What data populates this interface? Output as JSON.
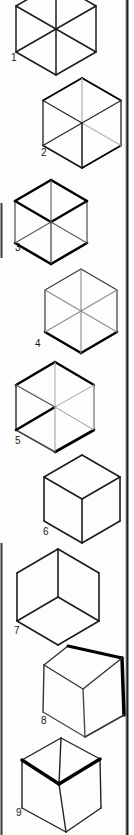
{
  "page": {
    "background": "#fdfdfd",
    "width": 134,
    "height": 835,
    "rules": [
      {
        "name": "right-column-rule-gray",
        "x": 125.8,
        "y1": 0,
        "y2": 835,
        "width": 1,
        "color": "#b5b5b5"
      },
      {
        "name": "right-column-rule",
        "x": 127.4,
        "y1": 0,
        "y2": 835,
        "width": 2.2,
        "color": "#1e1e1e"
      },
      {
        "name": "left-page-edge-upper",
        "x": 1.5,
        "y1": 203,
        "y2": 258,
        "width": 2,
        "color": "#3a3a3a"
      },
      {
        "name": "left-page-edge-lower",
        "x": 1.5,
        "y1": 543,
        "y2": 835,
        "width": 2,
        "color": "#3a3a3a"
      }
    ],
    "label_font_size": 10
  },
  "figures": [
    {
      "label": "1",
      "type": "hexagon-all-diagonals-uniform",
      "label_pos": {
        "x": 11,
        "y": 61
      },
      "points": {
        "T": [
          56,
          -17
        ],
        "UL": [
          16,
          6
        ],
        "LL": [
          16,
          52
        ],
        "B": [
          56,
          75
        ],
        "LR": [
          96,
          52
        ],
        "UR": [
          96,
          6
        ],
        "C": [
          56,
          29
        ]
      },
      "lines": [
        {
          "from": "T",
          "to": "UL",
          "w": 1.5,
          "c": "#1c1c1c"
        },
        {
          "from": "T",
          "to": "UR",
          "w": 1.5,
          "c": "#1c1c1c"
        },
        {
          "from": "UL",
          "to": "LL",
          "w": 1.5,
          "c": "#1c1c1c"
        },
        {
          "from": "UR",
          "to": "LR",
          "w": 1.5,
          "c": "#1c1c1c"
        },
        {
          "from": "LL",
          "to": "B",
          "w": 1.5,
          "c": "#1c1c1c"
        },
        {
          "from": "LR",
          "to": "B",
          "w": 1.5,
          "c": "#1c1c1c"
        },
        {
          "from": "T",
          "to": "B",
          "w": 1.5,
          "c": "#1c1c1c"
        },
        {
          "from": "UL",
          "to": "LR",
          "w": 1.5,
          "c": "#1c1c1c"
        },
        {
          "from": "UR",
          "to": "LL",
          "w": 1.5,
          "c": "#1c1c1c"
        }
      ]
    },
    {
      "label": "2",
      "type": "hexagon-hidden-edges-gray",
      "label_pos": {
        "x": 41,
        "y": 156
      },
      "points": {
        "T": [
          82,
          78
        ],
        "UL": [
          43,
          100.5
        ],
        "LL": [
          43,
          145.5
        ],
        "B": [
          82,
          168
        ],
        "LR": [
          121,
          145.5
        ],
        "UR": [
          121,
          100.5
        ],
        "C": [
          82,
          123
        ]
      },
      "lines": [
        {
          "from": "T",
          "to": "UL",
          "w": 2.0,
          "c": "#000000"
        },
        {
          "from": "T",
          "to": "UR",
          "w": 2.0,
          "c": "#000000"
        },
        {
          "from": "UL",
          "to": "LL",
          "w": 1.3,
          "c": "#222222"
        },
        {
          "from": "UR",
          "to": "LR",
          "w": 1.3,
          "c": "#222222"
        },
        {
          "from": "LL",
          "to": "B",
          "w": 1.5,
          "c": "#111111"
        },
        {
          "from": "LR",
          "to": "B",
          "w": 1.8,
          "c": "#000000"
        },
        {
          "from": "C",
          "to": "T",
          "w": 1.2,
          "c": "#b3b3b3"
        },
        {
          "from": "C",
          "to": "LR",
          "w": 1.2,
          "c": "#b3b3b3"
        },
        {
          "from": "C",
          "to": "UL",
          "w": 1.4,
          "c": "#2e2e2e"
        },
        {
          "from": "C",
          "to": "UR",
          "w": 1.4,
          "c": "#2e2e2e"
        },
        {
          "from": "C",
          "to": "LL",
          "w": 1.4,
          "c": "#2e2e2e"
        },
        {
          "from": "C",
          "to": "B",
          "w": 1.5,
          "c": "#1a1a1a"
        }
      ]
    },
    {
      "label": "3",
      "type": "hexagon-top-face-and-bottom-edges-bold",
      "label_pos": {
        "x": 15,
        "y": 251
      },
      "points": {
        "T": [
          51,
          180
        ],
        "UL": [
          15,
          201
        ],
        "LL": [
          15,
          243
        ],
        "B": [
          51,
          264
        ],
        "LR": [
          87,
          243
        ],
        "UR": [
          87,
          201
        ],
        "C": [
          51,
          222
        ]
      },
      "lines": [
        {
          "from": "T",
          "to": "UL",
          "w": 2.6,
          "c": "#000000"
        },
        {
          "from": "T",
          "to": "UR",
          "w": 2.6,
          "c": "#000000"
        },
        {
          "from": "LL",
          "to": "B",
          "w": 2.6,
          "c": "#000000"
        },
        {
          "from": "LR",
          "to": "B",
          "w": 2.6,
          "c": "#000000"
        },
        {
          "from": "UL",
          "to": "LL",
          "w": 1.1,
          "c": "#3d3d3d"
        },
        {
          "from": "UR",
          "to": "LR",
          "w": 1.1,
          "c": "#3d3d3d"
        },
        {
          "from": "C",
          "to": "UL",
          "w": 2.4,
          "c": "#000000"
        },
        {
          "from": "C",
          "to": "UR",
          "w": 2.4,
          "c": "#000000"
        },
        {
          "from": "C",
          "to": "T",
          "w": 1.1,
          "c": "#5a5a5a"
        },
        {
          "from": "C",
          "to": "LL",
          "w": 1.1,
          "c": "#5a5a5a"
        },
        {
          "from": "C",
          "to": "LR",
          "w": 1.1,
          "c": "#5a5a5a"
        },
        {
          "from": "C",
          "to": "B",
          "w": 1.2,
          "c": "#3d3d3d"
        }
      ]
    },
    {
      "label": "4",
      "type": "hexagon-thin-with-bold-bottom-edges",
      "label_pos": {
        "x": 35,
        "y": 347
      },
      "points": {
        "T": [
          81,
          269
        ],
        "UL": [
          45,
          290
        ],
        "LL": [
          45,
          332
        ],
        "B": [
          81,
          353
        ],
        "LR": [
          117,
          332
        ],
        "UR": [
          117,
          290
        ],
        "C": [
          81,
          311
        ]
      },
      "lines": [
        {
          "from": "T",
          "to": "UL",
          "w": 1.2,
          "c": "#3a3a3a"
        },
        {
          "from": "T",
          "to": "UR",
          "w": 1.2,
          "c": "#3a3a3a"
        },
        {
          "from": "UL",
          "to": "LL",
          "w": 1.2,
          "c": "#3a3a3a"
        },
        {
          "from": "UR",
          "to": "LR",
          "w": 1.2,
          "c": "#3a3a3a"
        },
        {
          "from": "LL",
          "to": "B",
          "w": 2.6,
          "c": "#000000"
        },
        {
          "from": "LR",
          "to": "B",
          "w": 2.6,
          "c": "#000000"
        },
        {
          "from": "C",
          "to": "T",
          "w": 1.1,
          "c": "#8c8c8c"
        },
        {
          "from": "C",
          "to": "UL",
          "w": 1.1,
          "c": "#8c8c8c"
        },
        {
          "from": "C",
          "to": "UR",
          "w": 1.1,
          "c": "#8c8c8c"
        },
        {
          "from": "C",
          "to": "LL",
          "w": 1.1,
          "c": "#8c8c8c"
        },
        {
          "from": "C",
          "to": "LR",
          "w": 1.1,
          "c": "#8c8c8c"
        },
        {
          "from": "C",
          "to": "B",
          "w": 1.1,
          "c": "#8c8c8c"
        }
      ]
    },
    {
      "label": "5",
      "type": "hexagon-mixed-bold-edges",
      "label_pos": {
        "x": 15,
        "y": 444
      },
      "points": {
        "T": [
          55,
          362
        ],
        "UL": [
          16,
          385
        ],
        "LL": [
          16,
          430
        ],
        "B": [
          55,
          452
        ],
        "LR": [
          94,
          430
        ],
        "UR": [
          94,
          385
        ],
        "C": [
          55,
          407
        ]
      },
      "lines": [
        {
          "from": "T",
          "to": "UL",
          "w": 2.6,
          "c": "#000000"
        },
        {
          "from": "T",
          "to": "UR",
          "w": 2.2,
          "c": "#000000"
        },
        {
          "from": "UL",
          "to": "LL",
          "w": 1.5,
          "c": "#333333"
        },
        {
          "from": "UR",
          "to": "LR",
          "w": 1.0,
          "c": "#555555"
        },
        {
          "from": "LL",
          "to": "B",
          "w": 1.5,
          "c": "#444444"
        },
        {
          "from": "LR",
          "to": "B",
          "w": 2.6,
          "c": "#000000"
        },
        {
          "from": "C",
          "to": "LL",
          "w": 2.6,
          "c": "#000000"
        },
        {
          "from": "C",
          "to": "UL",
          "w": 1.4,
          "c": "#555555"
        },
        {
          "from": "C",
          "to": "T",
          "w": 1.0,
          "c": "#a8a8a8"
        },
        {
          "from": "C",
          "to": "UR",
          "w": 1.0,
          "c": "#a8a8a8"
        },
        {
          "from": "C",
          "to": "LR",
          "w": 1.0,
          "c": "#999999"
        },
        {
          "from": "C",
          "to": "B",
          "w": 1.0,
          "c": "#999999"
        }
      ]
    },
    {
      "label": "6",
      "type": "cube-viewed-from-above",
      "label_pos": {
        "x": 43,
        "y": 535
      },
      "points": {
        "T": [
          82,
          455
        ],
        "UL": [
          44,
          477
        ],
        "LL": [
          44,
          521
        ],
        "B": [
          82,
          543
        ],
        "LR": [
          120,
          521
        ],
        "UR": [
          120,
          477
        ],
        "C": [
          82,
          499
        ]
      },
      "lines": [
        {
          "from": "T",
          "to": "UL",
          "w": 1.6,
          "c": "#1c1c1c"
        },
        {
          "from": "T",
          "to": "UR",
          "w": 1.6,
          "c": "#1c1c1c"
        },
        {
          "from": "UL",
          "to": "LL",
          "w": 1.6,
          "c": "#1c1c1c"
        },
        {
          "from": "UR",
          "to": "LR",
          "w": 1.6,
          "c": "#1c1c1c"
        },
        {
          "from": "LL",
          "to": "B",
          "w": 1.6,
          "c": "#1c1c1c"
        },
        {
          "from": "LR",
          "to": "B",
          "w": 1.6,
          "c": "#1c1c1c"
        },
        {
          "from": "C",
          "to": "UL",
          "w": 1.6,
          "c": "#1c1c1c"
        },
        {
          "from": "C",
          "to": "UR",
          "w": 1.6,
          "c": "#1c1c1c"
        },
        {
          "from": "C",
          "to": "B",
          "w": 1.6,
          "c": "#1c1c1c"
        }
      ]
    },
    {
      "label": "7",
      "type": "cube-viewed-from-below",
      "label_pos": {
        "x": 14,
        "y": 634
      },
      "points": {
        "T": [
          58,
          549
        ],
        "UL": [
          17,
          573
        ],
        "LL": [
          17,
          621
        ],
        "B": [
          58,
          645
        ],
        "LR": [
          99,
          621
        ],
        "UR": [
          99,
          573
        ],
        "C": [
          58,
          597
        ]
      },
      "lines": [
        {
          "from": "T",
          "to": "UL",
          "w": 1.6,
          "c": "#1c1c1c"
        },
        {
          "from": "T",
          "to": "UR",
          "w": 1.6,
          "c": "#1c1c1c"
        },
        {
          "from": "UL",
          "to": "LL",
          "w": 1.6,
          "c": "#1c1c1c"
        },
        {
          "from": "UR",
          "to": "LR",
          "w": 1.6,
          "c": "#1c1c1c"
        },
        {
          "from": "LL",
          "to": "B",
          "w": 1.6,
          "c": "#1c1c1c"
        },
        {
          "from": "LR",
          "to": "B",
          "w": 1.6,
          "c": "#1c1c1c"
        },
        {
          "from": "C",
          "to": "T",
          "w": 1.6,
          "c": "#1c1c1c"
        },
        {
          "from": "C",
          "to": "LL",
          "w": 1.6,
          "c": "#1c1c1c"
        },
        {
          "from": "C",
          "to": "LR",
          "w": 1.6,
          "c": "#1c1c1c"
        }
      ]
    },
    {
      "label": "8",
      "type": "cube-from-above-bold-right-edge",
      "label_pos": {
        "x": 41,
        "y": 724
      },
      "points": {
        "T": [
          68,
          646
        ],
        "UL": [
          44,
          665
        ],
        "LL": [
          43,
          712
        ],
        "B": [
          85,
          737
        ],
        "LR": [
          124,
          715
        ],
        "UR": [
          122,
          658
        ],
        "C": [
          83,
          689
        ]
      },
      "lines": [
        {
          "from": "T",
          "to": "UL",
          "w": 1.4,
          "c": "#333333"
        },
        {
          "from": "T",
          "to": "UR",
          "w": 3.0,
          "c": "#000000"
        },
        {
          "from": "UL",
          "to": "LL",
          "w": 1.4,
          "c": "#333333"
        },
        {
          "from": "UR",
          "to": "LR",
          "w": 3.5,
          "c": "#000000"
        },
        {
          "from": "LL",
          "to": "B",
          "w": 1.4,
          "c": "#4a4a4a"
        },
        {
          "from": "LR",
          "to": "B",
          "w": 1.6,
          "c": "#333333"
        },
        {
          "from": "C",
          "to": "UL",
          "w": 1.4,
          "c": "#333333"
        },
        {
          "from": "C",
          "to": "UR",
          "w": 1.4,
          "c": "#333333"
        },
        {
          "from": "C",
          "to": "B",
          "w": 1.4,
          "c": "#4a4a4a"
        }
      ]
    },
    {
      "label": "9",
      "type": "open-cube-bold-front-top-edges",
      "label_pos": {
        "x": 16,
        "y": 816
      },
      "points": {
        "T": [
          61,
          738
        ],
        "UL": [
          22,
          760
        ],
        "LL": [
          22,
          808
        ],
        "B": [
          66,
          832
        ],
        "LR": [
          101,
          808
        ],
        "UR": [
          100,
          759
        ],
        "C": [
          59,
          784
        ]
      },
      "lines": [
        {
          "from": "T",
          "to": "UL",
          "w": 1.4,
          "c": "#222222"
        },
        {
          "from": "T",
          "to": "UR",
          "w": 1.4,
          "c": "#222222"
        },
        {
          "from": "UL",
          "to": "LL",
          "w": 1.4,
          "c": "#222222"
        },
        {
          "from": "UR",
          "to": "LR",
          "w": 1.4,
          "c": "#222222"
        },
        {
          "from": "LL",
          "to": "B",
          "w": 1.4,
          "c": "#222222"
        },
        {
          "from": "LR",
          "to": "B",
          "w": 1.4,
          "c": "#222222"
        },
        {
          "from": "T",
          "to": "C",
          "w": 1.4,
          "c": "#222222"
        },
        {
          "from": "C",
          "to": "B",
          "w": 1.4,
          "c": "#222222"
        },
        {
          "from": "C",
          "to": "UL",
          "w": 3.4,
          "c": "#000000"
        },
        {
          "from": "C",
          "to": "UR",
          "w": 3.4,
          "c": "#000000"
        }
      ]
    }
  ]
}
